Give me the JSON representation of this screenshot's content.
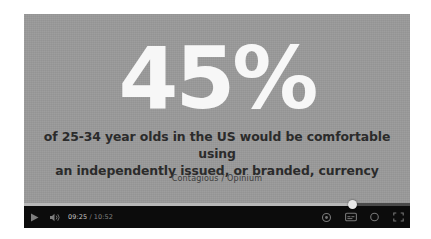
{
  "player": {
    "slide": {
      "background_color": "#9a9a9a",
      "headline": "45%",
      "body_line_1": "of 25-34 year olds in the US would be comfortable using",
      "body_line_2": "an independently issued, or branded, currency",
      "attribution": "Contagious / Opinium"
    },
    "controls": {
      "play_label": "play-button",
      "volume_label": "volume-button",
      "current_time": "09:25",
      "time_separator": " / ",
      "total_time": "10:52",
      "progress_percent": 85,
      "settings_label": "settings-button",
      "subtitles_label": "subtitles-button",
      "theater_label": "theater-mode-button",
      "fullscreen_label": "fullscreen-button"
    }
  }
}
